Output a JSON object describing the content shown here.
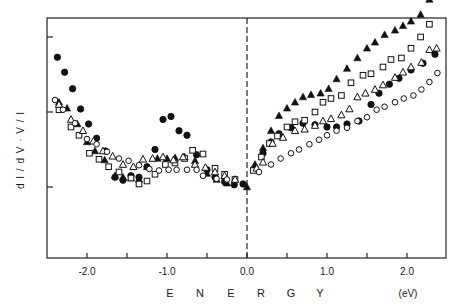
{
  "chart_data": {
    "type": "scatter",
    "title": "",
    "xlabel": "E N E R G Y",
    "xunit": "(eV)",
    "ylabel": "d I / d V · V / I",
    "xlim": [
      -2.5,
      2.5
    ],
    "ylim": [
      -1.0,
      2.25
    ],
    "x_ticks": [
      -2.0,
      -1.5,
      -1.0,
      -0.5,
      0.0,
      0.5,
      1.0,
      1.5,
      2.0
    ],
    "x_tick_labels": [
      "-2.0",
      "",
      "-1.0",
      "",
      "0.0",
      "",
      "1.0",
      "",
      "2.0"
    ],
    "y_ticks": [
      0,
      1,
      2
    ],
    "y_tick_labels": [
      "",
      "",
      ""
    ],
    "grid": false,
    "legend": "none",
    "annotations": [
      {
        "type": "dashed-vertical-line",
        "x": 0.0
      }
    ],
    "series": [
      {
        "name": "filled-circles",
        "marker": "circle-filled",
        "points": [
          [
            -2.37,
            1.73
          ],
          [
            -2.28,
            1.53
          ],
          [
            -2.18,
            1.31
          ],
          [
            -2.08,
            1.04
          ],
          [
            -1.98,
            0.84
          ],
          [
            -1.88,
            0.65
          ],
          [
            -1.77,
            0.48
          ],
          [
            -1.65,
            0.13
          ],
          [
            -1.55,
            0.09
          ],
          [
            -1.45,
            0.15
          ],
          [
            -1.35,
            0.13
          ],
          [
            -1.25,
            0.27
          ],
          [
            -1.15,
            0.5
          ],
          [
            -1.05,
            0.9
          ],
          [
            -0.95,
            0.94
          ],
          [
            -0.85,
            0.75
          ],
          [
            -0.75,
            0.69
          ],
          [
            -0.63,
            0.43
          ],
          [
            -0.5,
            0.23
          ],
          [
            -0.4,
            0.13
          ],
          [
            -0.28,
            0.07
          ],
          [
            -0.16,
            0.03
          ],
          [
            -0.05,
            0.04
          ],
          [
            0.1,
            0.25
          ],
          [
            0.2,
            0.45
          ],
          [
            0.3,
            0.6
          ],
          [
            0.4,
            0.71
          ],
          [
            0.55,
            0.79
          ],
          [
            0.7,
            0.85
          ],
          [
            0.85,
            0.83
          ],
          [
            1.0,
            0.8
          ],
          [
            1.12,
            0.8
          ],
          [
            1.25,
            0.84
          ],
          [
            1.4,
            0.88
          ],
          [
            1.55,
            1.1
          ],
          [
            1.65,
            1.25
          ],
          [
            1.78,
            1.37
          ],
          [
            1.9,
            1.45
          ],
          [
            2.05,
            1.56
          ],
          [
            2.2,
            1.65
          ],
          [
            2.35,
            1.77
          ]
        ]
      },
      {
        "name": "filled-triangles",
        "marker": "triangle-filled",
        "points": [
          [
            -2.35,
            1.13
          ],
          [
            -2.25,
            1.05
          ],
          [
            -2.12,
            0.84
          ],
          [
            -2.0,
            0.6
          ],
          [
            -1.9,
            0.48
          ],
          [
            -1.78,
            0.36
          ],
          [
            -1.65,
            0.15
          ],
          [
            -1.55,
            0.13
          ],
          [
            -1.45,
            0.12
          ],
          [
            -1.35,
            0.1
          ],
          [
            -1.25,
            0.27
          ],
          [
            -1.12,
            0.38
          ],
          [
            -1.0,
            0.38
          ],
          [
            -0.9,
            0.39
          ],
          [
            -0.78,
            0.4
          ],
          [
            -0.65,
            0.35
          ],
          [
            -0.5,
            0.18
          ],
          [
            -0.38,
            0.1
          ],
          [
            -0.25,
            0.05
          ],
          [
            0.0,
            0.0
          ],
          [
            0.1,
            0.3
          ],
          [
            0.2,
            0.52
          ],
          [
            0.3,
            0.75
          ],
          [
            0.4,
            0.95
          ],
          [
            0.5,
            1.05
          ],
          [
            0.6,
            1.13
          ],
          [
            0.7,
            1.2
          ],
          [
            0.8,
            1.23
          ],
          [
            0.92,
            1.25
          ],
          [
            1.02,
            1.31
          ],
          [
            1.12,
            1.44
          ],
          [
            1.25,
            1.58
          ],
          [
            1.38,
            1.72
          ],
          [
            1.5,
            1.85
          ],
          [
            1.6,
            1.93
          ],
          [
            1.72,
            2.03
          ],
          [
            1.85,
            2.09
          ],
          [
            1.95,
            2.15
          ],
          [
            2.05,
            2.21
          ],
          [
            2.17,
            2.3
          ],
          [
            2.28,
            2.5
          ]
        ]
      },
      {
        "name": "open-squares",
        "marker": "square-open",
        "points": [
          [
            -2.35,
            1.03
          ],
          [
            -2.2,
            0.8
          ],
          [
            -2.1,
            0.69
          ],
          [
            -1.97,
            0.45
          ],
          [
            -1.85,
            0.37
          ],
          [
            -1.73,
            0.27
          ],
          [
            -1.6,
            0.2
          ],
          [
            -1.45,
            0.12
          ],
          [
            -1.35,
            0.04
          ],
          [
            -1.25,
            0.08
          ],
          [
            -1.15,
            0.17
          ],
          [
            -1.02,
            0.3
          ],
          [
            -0.9,
            0.32
          ],
          [
            -0.78,
            0.38
          ],
          [
            -0.68,
            0.49
          ],
          [
            -0.55,
            0.44
          ],
          [
            -0.4,
            0.25
          ],
          [
            -0.28,
            0.17
          ],
          [
            -0.15,
            0.1
          ],
          [
            0.08,
            0.22
          ],
          [
            0.18,
            0.4
          ],
          [
            0.28,
            0.58
          ],
          [
            0.38,
            0.68
          ],
          [
            0.5,
            0.8
          ],
          [
            0.6,
            0.87
          ],
          [
            0.72,
            0.89
          ],
          [
            0.85,
            1.0
          ],
          [
            0.95,
            1.13
          ],
          [
            1.05,
            1.18
          ],
          [
            1.18,
            1.22
          ],
          [
            1.3,
            1.39
          ],
          [
            1.45,
            1.49
          ],
          [
            1.55,
            1.51
          ],
          [
            1.7,
            1.6
          ],
          [
            1.8,
            1.7
          ],
          [
            1.93,
            1.72
          ],
          [
            2.05,
            1.85
          ],
          [
            2.17,
            2.0
          ],
          [
            2.28,
            2.17
          ]
        ]
      },
      {
        "name": "open-triangles",
        "marker": "triangle-open",
        "points": [
          [
            -2.35,
            1.1
          ],
          [
            -2.2,
            0.9
          ],
          [
            -2.05,
            0.75
          ],
          [
            -1.92,
            0.61
          ],
          [
            -1.8,
            0.48
          ],
          [
            -1.68,
            0.41
          ],
          [
            -1.55,
            0.3
          ],
          [
            -1.42,
            0.27
          ],
          [
            -1.3,
            0.37
          ],
          [
            -1.18,
            0.38
          ],
          [
            -1.05,
            0.4
          ],
          [
            -0.92,
            0.36
          ],
          [
            -0.8,
            0.4
          ],
          [
            -0.65,
            0.3
          ],
          [
            -0.52,
            0.26
          ],
          [
            -0.4,
            0.2
          ],
          [
            -0.28,
            0.15
          ],
          [
            -0.15,
            0.1
          ],
          [
            0.12,
            0.25
          ],
          [
            0.2,
            0.33
          ],
          [
            0.32,
            0.58
          ],
          [
            0.45,
            0.66
          ],
          [
            0.6,
            0.75
          ],
          [
            0.72,
            0.77
          ],
          [
            0.85,
            0.82
          ],
          [
            0.95,
            0.88
          ],
          [
            1.05,
            0.91
          ],
          [
            1.18,
            0.96
          ],
          [
            1.28,
            1.04
          ],
          [
            1.38,
            1.2
          ],
          [
            1.48,
            1.25
          ],
          [
            1.6,
            1.3
          ],
          [
            1.7,
            1.36
          ],
          [
            1.85,
            1.46
          ],
          [
            1.95,
            1.53
          ],
          [
            2.05,
            1.6
          ],
          [
            2.18,
            1.66
          ],
          [
            2.28,
            1.83
          ],
          [
            2.37,
            1.85
          ]
        ]
      },
      {
        "name": "open-circles",
        "marker": "circle-open",
        "points": [
          [
            -2.4,
            1.16
          ],
          [
            -2.3,
            1.03
          ],
          [
            -2.15,
            0.85
          ],
          [
            -2.0,
            0.64
          ],
          [
            -1.88,
            0.57
          ],
          [
            -1.75,
            0.47
          ],
          [
            -1.6,
            0.38
          ],
          [
            -1.48,
            0.35
          ],
          [
            -1.35,
            0.29
          ],
          [
            -1.22,
            0.24
          ],
          [
            -1.1,
            0.22
          ],
          [
            -0.98,
            0.23
          ],
          [
            -0.88,
            0.23
          ],
          [
            -0.75,
            0.23
          ],
          [
            -0.63,
            0.23
          ],
          [
            -0.55,
            0.15
          ],
          [
            -0.38,
            0.11
          ],
          [
            -0.25,
            0.1
          ],
          [
            0.15,
            0.2
          ],
          [
            0.3,
            0.3
          ],
          [
            0.42,
            0.38
          ],
          [
            0.55,
            0.45
          ],
          [
            0.65,
            0.5
          ],
          [
            0.78,
            0.57
          ],
          [
            0.9,
            0.63
          ],
          [
            1.0,
            0.69
          ],
          [
            1.12,
            0.75
          ],
          [
            1.25,
            0.79
          ],
          [
            1.38,
            0.88
          ],
          [
            1.5,
            0.93
          ],
          [
            1.62,
            1.03
          ],
          [
            1.72,
            1.07
          ],
          [
            1.85,
            1.13
          ],
          [
            1.96,
            1.18
          ],
          [
            2.08,
            1.22
          ],
          [
            2.18,
            1.3
          ],
          [
            2.28,
            1.4
          ],
          [
            2.38,
            1.52
          ]
        ]
      }
    ]
  },
  "axis": {
    "x_tick_labels": [
      "-2.0",
      "-1.0",
      "0.0",
      "1.0",
      "2.0"
    ],
    "x_title_letters": [
      "E",
      "N",
      "E",
      "R",
      "G",
      "Y"
    ],
    "x_unit": "(eV)",
    "y_title": "d I / d V · V / I"
  }
}
